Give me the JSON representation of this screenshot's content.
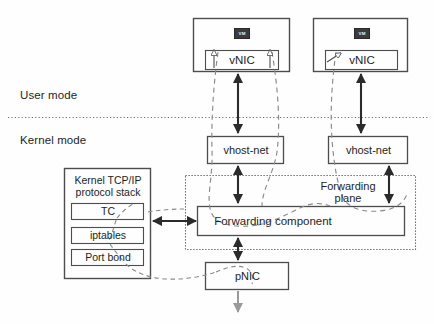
{
  "diagram": {
    "mode_labels": {
      "user_mode": "User mode",
      "kernel_mode": "Kernel mode"
    },
    "vms": [
      {
        "badge": "VM",
        "vnic_label": "vNIC"
      },
      {
        "badge": "VM",
        "vnic_label": "vNIC"
      }
    ],
    "vhost_nets": [
      {
        "label": "vhost-net"
      },
      {
        "label": "vhost-net"
      }
    ],
    "kernel_stack": {
      "title_line1": "Kernel TCP/IP",
      "title_line2": "protocol stack",
      "items": [
        {
          "label": "TC"
        },
        {
          "label": "iptables"
        },
        {
          "label": "Port bond"
        }
      ]
    },
    "forwarding_plane": {
      "label_line1": "Forwarding",
      "label_line2": "plane"
    },
    "forwarding_component": {
      "label": "Forwarding component"
    },
    "pnic": {
      "label": "pNIC"
    },
    "colors": {
      "stroke": "#4d4d4f",
      "text": "#231f20",
      "badge_bg": "#3b3b3d",
      "badge_fg": "#f2f2f2",
      "dashed": "#8a8a8c",
      "background": "#fefefe"
    }
  }
}
